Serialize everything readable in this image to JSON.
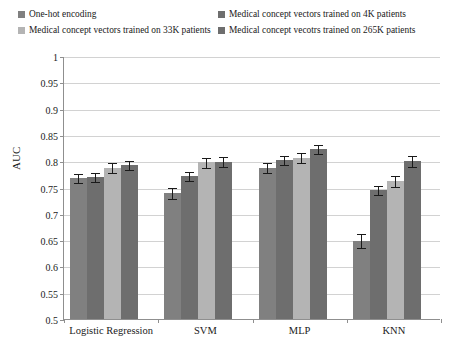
{
  "chart_data": {
    "type": "bar",
    "title": "",
    "xlabel": "",
    "ylabel": "AUC",
    "ylim": [
      0.5,
      1
    ],
    "ytick_labels": [
      "1",
      "0.95",
      "0.9",
      "0.85",
      "0.8",
      "0.75",
      "0.7",
      "0.65",
      "0.6",
      "0.55",
      "0.5"
    ],
    "ytick_values": [
      1,
      0.95,
      0.9,
      0.85,
      0.8,
      0.75,
      0.7,
      0.65,
      0.6,
      0.55,
      0.5
    ],
    "grid": true,
    "legend_position": "top",
    "categories": [
      "Logistic Regression",
      "SVM",
      "MLP",
      "KNN"
    ],
    "series": [
      {
        "name": "One-hot encoding",
        "color": "#808080",
        "values": [
          0.768,
          0.74,
          0.788,
          0.649
        ],
        "errors": [
          0.009,
          0.011,
          0.01,
          0.014
        ]
      },
      {
        "name": "Medical concept vectors trained on 4K patients",
        "color": "#6e6e6e",
        "values": [
          0.77,
          0.772,
          0.802,
          0.745
        ],
        "errors": [
          0.009,
          0.01,
          0.01,
          0.01
        ]
      },
      {
        "name": "Medical concept vectors trained on 33K patients",
        "color": "#b4b4b4",
        "values": [
          0.788,
          0.798,
          0.807,
          0.762
        ],
        "errors": [
          0.01,
          0.01,
          0.011,
          0.011
        ]
      },
      {
        "name": "Medical concept vecotrs trained on 265K patients",
        "color": "#6e6e6e",
        "values": [
          0.793,
          0.799,
          0.823,
          0.8
        ],
        "errors": [
          0.01,
          0.01,
          0.01,
          0.011
        ]
      }
    ]
  }
}
